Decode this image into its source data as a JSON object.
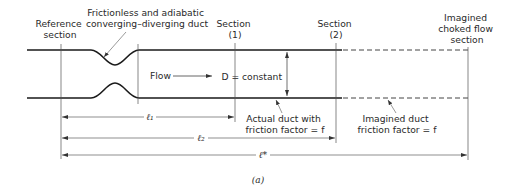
{
  "figure": {
    "caption": "(a)",
    "colors": {
      "line": "#1a1a1a",
      "thin": "#555555",
      "text": "#2a2a2a",
      "background": "#ffffff"
    }
  },
  "labels": {
    "reference": [
      "Reference",
      "section"
    ],
    "nozzle": [
      "Frictionless and adiabatic",
      "converging–diverging duct"
    ],
    "section1": [
      "Section",
      "(1)"
    ],
    "section2": [
      "Section",
      "(2)"
    ],
    "choked": [
      "Imagined",
      "choked flow",
      "section"
    ],
    "flow": "Flow",
    "diameter": "D = constant",
    "actual_duct": [
      "Actual duct with",
      "friction factor = f"
    ],
    "imagined_duct": [
      "Imagined duct",
      "friction factor = f"
    ]
  },
  "dimensions": {
    "l1": "ℓ₁",
    "l2": "ℓ₂",
    "lstar": "ℓ*"
  }
}
